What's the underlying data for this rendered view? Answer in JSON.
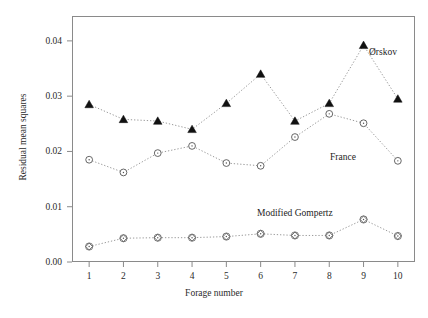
{
  "chart_data": {
    "type": "line",
    "title": "",
    "xlabel": "Forage number",
    "ylabel": "Residual mean squares",
    "x": [
      1,
      2,
      3,
      4,
      5,
      6,
      7,
      8,
      9,
      10
    ],
    "xlim": [
      0.5,
      10.5
    ],
    "ylim": [
      0.0,
      0.0445
    ],
    "yticks": [
      "0.00",
      "0.01",
      "0.02",
      "0.03",
      "0.04"
    ],
    "ytick_values": [
      0.0,
      0.01,
      0.02,
      0.03,
      0.04
    ],
    "xticks": [
      "1",
      "2",
      "3",
      "4",
      "5",
      "6",
      "7",
      "8",
      "9",
      "10"
    ],
    "grid": false,
    "legend": "inline-annotations",
    "series": [
      {
        "name": "Ørskov",
        "marker": "filled-triangle",
        "line_style": "dotted",
        "color": "#111111",
        "values": [
          0.0285,
          0.0258,
          0.0255,
          0.024,
          0.0287,
          0.034,
          0.0255,
          0.0287,
          0.0392,
          0.0295
        ]
      },
      {
        "name": "France",
        "marker": "open-circle",
        "line_style": "dotted",
        "color": "#555555",
        "values": [
          0.0185,
          0.0162,
          0.0197,
          0.021,
          0.0179,
          0.0174,
          0.0226,
          0.0268,
          0.0251,
          0.0183
        ]
      },
      {
        "name": "Modified Gompertz",
        "marker": "circled-diamond",
        "line_style": "dotted",
        "color": "#555555",
        "values": [
          0.0028,
          0.0043,
          0.0044,
          0.0044,
          0.0046,
          0.0051,
          0.0048,
          0.0048,
          0.0077,
          0.0047
        ]
      }
    ]
  },
  "annotations": {
    "orskov": "Ørskov",
    "france": "France",
    "gompertz": "Modified Gompertz"
  }
}
